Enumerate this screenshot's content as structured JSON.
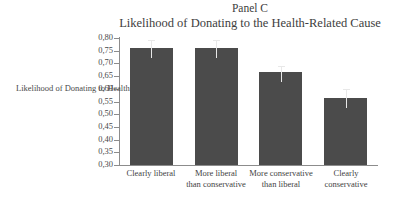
{
  "chart_data": {
    "type": "bar",
    "title": "Panel C",
    "subtitle": "Likelihood of Donating to the Health-Related Cause",
    "xlabel": "",
    "ylabel": "Likelihood of Donating to Health",
    "ylim": [
      0.3,
      0.8
    ],
    "ytick_step": 0.05,
    "decimal_separator": ",",
    "grid": false,
    "legend": null,
    "bar_color": "#4b4b4b",
    "error_bar_color": "#e8e8e8",
    "categories": [
      "Clearly liberal",
      "More liberal than conservative",
      "More conservative than liberal",
      "Clearly conservative"
    ],
    "category_lines": [
      [
        "Clearly liberal"
      ],
      [
        "More liberal",
        "than conservative"
      ],
      [
        "More conservative",
        "than liberal"
      ],
      [
        "Clearly",
        "conservative"
      ]
    ],
    "values": [
      0.762,
      0.762,
      0.665,
      0.565
    ],
    "error_upper": [
      0.031,
      0.03,
      0.026,
      0.035
    ],
    "ytick_labels": [
      "0,80",
      "0,75",
      "0,70",
      "0,65",
      "0,60",
      "0,55",
      "0,50",
      "0,45",
      "0,40",
      "0,35",
      "0,30"
    ],
    "ytick_values": [
      0.8,
      0.75,
      0.7,
      0.65,
      0.6,
      0.55,
      0.5,
      0.45,
      0.4,
      0.35,
      0.3
    ]
  }
}
